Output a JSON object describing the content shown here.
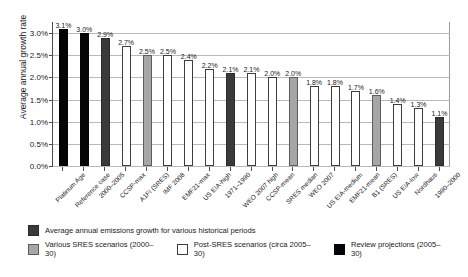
{
  "chart_data": {
    "type": "bar",
    "title": "",
    "xlabel": "",
    "ylabel": "Average annual growth rate",
    "ylim": [
      0,
      3.25
    ],
    "grid": true,
    "legend_position": "bottom",
    "ytick_labels": [
      "3.0%",
      "2.5%",
      "2.0%",
      "1.5%",
      "1.0%",
      "0.5%",
      "0.0%"
    ],
    "ytick_values": [
      3.0,
      2.5,
      2.0,
      1.5,
      1.0,
      0.5,
      0.0
    ],
    "categories": [
      "Platinum Age",
      "Reference case",
      "2000–2005",
      "CCSP-max",
      "A1FI (SRES)",
      "IMF 2008",
      "EMF21-max",
      "US EIA-high",
      "1971–1990",
      "WEO 2007 high",
      "CCSP-mean",
      "SRES median",
      "WEO 2007",
      "US EIA-medium",
      "EMF21-mean",
      "B1 (SRES)",
      "US EIA-low",
      "Nordhaus",
      "1990–2000"
    ],
    "values": [
      3.1,
      3.0,
      2.9,
      2.7,
      2.5,
      2.5,
      2.4,
      2.2,
      2.1,
      2.1,
      2.0,
      2.0,
      1.8,
      1.8,
      1.7,
      1.6,
      1.4,
      1.3,
      1.1
    ],
    "data_labels": [
      "3.1%",
      "3.0%",
      "2.9%",
      "2.7%",
      "2.5%",
      "2.5%",
      "2.4%",
      "2.2%",
      "2.1%",
      "2.1%",
      "2.0%",
      "2.0%",
      "1.8%",
      "1.8%",
      "1.7%",
      "1.6%",
      "1.4%",
      "1.3%",
      "1.1%"
    ],
    "series_class": [
      "review",
      "review",
      "hist",
      "post",
      "sres",
      "post",
      "post",
      "post",
      "hist",
      "post",
      "post",
      "sres",
      "post",
      "post",
      "post",
      "sres",
      "post",
      "post",
      "hist"
    ],
    "colors": {
      "hist": "#3a3a3a",
      "sres": "#a6a6a6",
      "post": "#ffffff",
      "review": "#050505",
      "grid": "#b9b9b9",
      "axis": "#4d4d4d"
    },
    "legend": [
      {
        "key": "hist",
        "label": "Average annual emissions growth for various historical periods"
      },
      {
        "key": "sres",
        "label": "Various SRES scenarios (2000–30)"
      },
      {
        "key": "post",
        "label": "Post-SRES scenarios (circa 2005–30)"
      },
      {
        "key": "review",
        "label": "Review projections (2005–30)"
      }
    ]
  }
}
